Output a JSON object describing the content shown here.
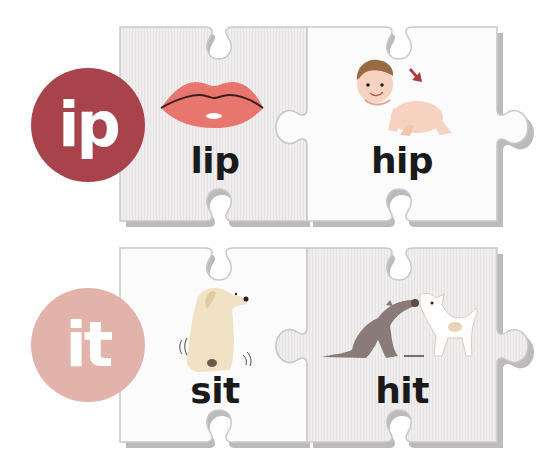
{
  "rows": [
    {
      "family": "ip",
      "badge_color": "#a9434b",
      "cards": [
        {
          "word": "lip",
          "picture": "lips",
          "bg": "#efeded"
        },
        {
          "word": "hip",
          "picture": "crawling-baby-pointing-to-hip",
          "bg": "#fbfbfb"
        }
      ]
    },
    {
      "family": "it",
      "badge_color": "#e2b3ab",
      "cards": [
        {
          "word": "sit",
          "picture": "sitting-dog",
          "bg": "#fbfbfb"
        },
        {
          "word": "hit",
          "picture": "cat-hitting-dog",
          "bg": "#efeded"
        }
      ]
    }
  ],
  "colors": {
    "piece_edge": "#c9c7c7",
    "piece_shadow": "#bdbaba",
    "lips": "#e8766f",
    "lips_line": "#3a2020",
    "baby_skin": "#f6d3c0",
    "baby_hair": "#9a6a45",
    "arrow": "#a83a3a",
    "dog": "#f1e2c6",
    "cat": "#8a7b78"
  }
}
